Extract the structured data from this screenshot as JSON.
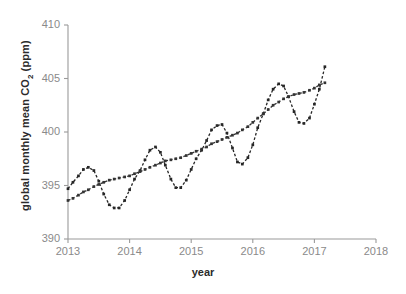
{
  "chart_data": {
    "type": "line",
    "title": "",
    "xlabel": "year",
    "ylabel": "global monthly mean CO2 (ppm)",
    "ylabel_parts": {
      "pre": "global monthly mean CO",
      "sub": "2",
      "post": " (ppm)"
    },
    "xlim": [
      2013,
      2018
    ],
    "ylim": [
      390,
      410
    ],
    "xticks": [
      2013,
      2014,
      2015,
      2016,
      2017,
      2018
    ],
    "xtick_labels": [
      "2013",
      "2014",
      "2015",
      "2016",
      "2017",
      "2018"
    ],
    "yticks": [
      390,
      395,
      400,
      405,
      410
    ],
    "ytick_labels": [
      "390",
      "395",
      "400",
      "405",
      "410"
    ],
    "grid": false,
    "legend": "none",
    "marker": "square",
    "line_style": "dashed",
    "series": [
      {
        "name": "global monthly mean CO2",
        "color": "#262626",
        "x": [
          2013.0,
          2013.08,
          2013.17,
          2013.25,
          2013.33,
          2013.42,
          2013.5,
          2013.58,
          2013.67,
          2013.75,
          2013.83,
          2013.92,
          2014.0,
          2014.08,
          2014.17,
          2014.25,
          2014.33,
          2014.42,
          2014.5,
          2014.58,
          2014.67,
          2014.75,
          2014.83,
          2014.92,
          2015.0,
          2015.08,
          2015.17,
          2015.25,
          2015.33,
          2015.42,
          2015.5,
          2015.58,
          2015.67,
          2015.75,
          2015.83,
          2015.92,
          2016.0,
          2016.08,
          2016.17,
          2016.25,
          2016.33,
          2016.42,
          2016.5,
          2016.58,
          2016.67,
          2016.75,
          2016.83,
          2016.92,
          2017.0,
          2017.08,
          2017.17
        ],
        "y": [
          394.7,
          395.3,
          395.9,
          396.5,
          396.7,
          396.4,
          395.4,
          394.2,
          393.2,
          392.9,
          392.9,
          393.6,
          394.6,
          395.6,
          396.4,
          397.4,
          398.3,
          398.6,
          398.1,
          396.9,
          395.6,
          394.8,
          394.8,
          395.5,
          396.5,
          397.5,
          398.3,
          399.2,
          400.2,
          400.6,
          400.7,
          399.9,
          398.5,
          397.2,
          397.0,
          397.6,
          398.8,
          400.4,
          401.7,
          403.0,
          404.0,
          404.5,
          404.3,
          403.3,
          401.9,
          400.9,
          400.8,
          401.3,
          402.6,
          404.0,
          406.1
        ]
      },
      {
        "name": "trend (seasonally adjusted)",
        "color": "#333333",
        "x": [
          2013.0,
          2013.08,
          2013.17,
          2013.25,
          2013.33,
          2013.42,
          2013.5,
          2013.58,
          2013.67,
          2013.75,
          2013.83,
          2013.92,
          2014.0,
          2014.08,
          2014.17,
          2014.25,
          2014.33,
          2014.42,
          2014.5,
          2014.58,
          2014.67,
          2014.75,
          2014.83,
          2014.92,
          2015.0,
          2015.08,
          2015.17,
          2015.25,
          2015.33,
          2015.42,
          2015.5,
          2015.58,
          2015.67,
          2015.75,
          2015.83,
          2015.92,
          2016.0,
          2016.08,
          2016.17,
          2016.25,
          2016.33,
          2016.42,
          2016.5,
          2016.58,
          2016.67,
          2016.75,
          2016.83,
          2016.92,
          2017.0,
          2017.08,
          2017.17
        ],
        "y": [
          393.6,
          393.8,
          394.1,
          394.4,
          394.6,
          394.9,
          395.1,
          395.3,
          395.5,
          395.6,
          395.7,
          395.8,
          395.9,
          396.1,
          396.3,
          396.5,
          396.7,
          396.9,
          397.1,
          397.3,
          397.4,
          397.5,
          397.6,
          397.8,
          398.0,
          398.2,
          398.4,
          398.6,
          398.9,
          399.1,
          399.3,
          399.5,
          399.7,
          399.9,
          400.2,
          400.5,
          400.9,
          401.3,
          401.7,
          402.1,
          402.5,
          402.8,
          403.1,
          403.3,
          403.5,
          403.6,
          403.7,
          403.9,
          404.1,
          404.4,
          404.6
        ]
      }
    ],
    "axis_color": "#9a9a9a",
    "tick_label_color": "#8a8a8a",
    "background": "#ffffff"
  }
}
